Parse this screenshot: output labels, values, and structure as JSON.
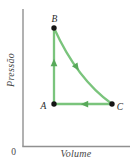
{
  "figure": {
    "axes": {
      "y_label": "Pressão",
      "x_label": "Volume",
      "origin_label": "0"
    },
    "points": {
      "A": {
        "label": "A"
      },
      "B": {
        "label": "B"
      },
      "C": {
        "label": "C"
      }
    },
    "processes": [
      {
        "from": "A",
        "to": "B",
        "path_shape": "vertical-line",
        "arrow_direction": "up"
      },
      {
        "from": "B",
        "to": "C",
        "path_shape": "concave-curve",
        "arrow_direction": "down-right"
      },
      {
        "from": "C",
        "to": "A",
        "path_shape": "horizontal-line",
        "arrow_direction": "left"
      }
    ],
    "colors": {
      "process_line": "#7ac47c",
      "arrowhead": "#58a95a",
      "axis": "#909090",
      "dot": "#141414",
      "point_label": "#2b2b2b",
      "axis_label": "#474747"
    }
  }
}
